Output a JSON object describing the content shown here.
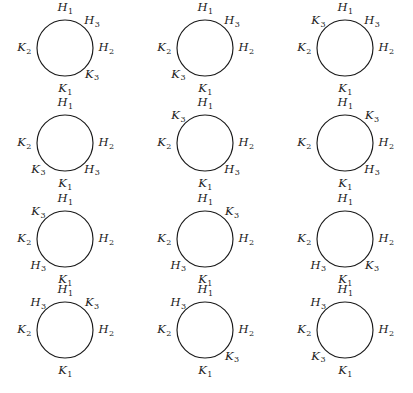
{
  "figure": {
    "background_color": "#ffffff",
    "stroke_color": "#1a1a1a",
    "grid": {
      "rows": 4,
      "columns": 3,
      "cell_count": 12
    },
    "circle": {
      "radius": 28,
      "stroke_width": 1.15
    },
    "label_symbols": [
      "H1",
      "H2",
      "H3",
      "K1",
      "K2",
      "K3"
    ],
    "angles_legend": {
      "top": 90,
      "upper_right": 45,
      "right": 0,
      "lower_right": 315,
      "bottom": 270,
      "lower_left": 225,
      "left": 180,
      "upper_left": 135
    }
  },
  "diagrams": [
    {
      "id": "diagram-1",
      "row": 1,
      "column": 1,
      "center_x": 65,
      "center_y": 48,
      "labels": [
        {
          "name": "H1",
          "base": "H",
          "sub": "1",
          "angle": 90
        },
        {
          "name": "H3",
          "base": "H",
          "sub": "3",
          "angle": 45
        },
        {
          "name": "H2",
          "base": "H",
          "sub": "2",
          "angle": 0
        },
        {
          "name": "K3",
          "base": "K",
          "sub": "3",
          "angle": 315
        },
        {
          "name": "K1",
          "base": "K",
          "sub": "1",
          "angle": 270
        },
        {
          "name": "K2",
          "base": "K",
          "sub": "2",
          "angle": 180
        }
      ]
    },
    {
      "id": "diagram-2",
      "row": 1,
      "column": 2,
      "center_x": 205,
      "center_y": 48,
      "labels": [
        {
          "name": "H1",
          "base": "H",
          "sub": "1",
          "angle": 90
        },
        {
          "name": "H3",
          "base": "H",
          "sub": "3",
          "angle": 45
        },
        {
          "name": "H2",
          "base": "H",
          "sub": "2",
          "angle": 0
        },
        {
          "name": "K1",
          "base": "K",
          "sub": "1",
          "angle": 270
        },
        {
          "name": "K3",
          "base": "K",
          "sub": "3",
          "angle": 225
        },
        {
          "name": "K2",
          "base": "K",
          "sub": "2",
          "angle": 180
        }
      ]
    },
    {
      "id": "diagram-3",
      "row": 1,
      "column": 3,
      "center_x": 345,
      "center_y": 48,
      "labels": [
        {
          "name": "H1",
          "base": "H",
          "sub": "1",
          "angle": 90
        },
        {
          "name": "H3",
          "base": "H",
          "sub": "3",
          "angle": 45
        },
        {
          "name": "H2",
          "base": "H",
          "sub": "2",
          "angle": 0
        },
        {
          "name": "K1",
          "base": "K",
          "sub": "1",
          "angle": 270
        },
        {
          "name": "K2",
          "base": "K",
          "sub": "2",
          "angle": 180
        },
        {
          "name": "K3",
          "base": "K",
          "sub": "3",
          "angle": 135
        }
      ]
    },
    {
      "id": "diagram-4",
      "row": 2,
      "column": 1,
      "center_x": 65,
      "center_y": 143,
      "labels": [
        {
          "name": "H1",
          "base": "H",
          "sub": "1",
          "angle": 90
        },
        {
          "name": "H2",
          "base": "H",
          "sub": "2",
          "angle": 0
        },
        {
          "name": "H3",
          "base": "H",
          "sub": "3",
          "angle": 315
        },
        {
          "name": "K1",
          "base": "K",
          "sub": "1",
          "angle": 270
        },
        {
          "name": "K3",
          "base": "K",
          "sub": "3",
          "angle": 225
        },
        {
          "name": "K2",
          "base": "K",
          "sub": "2",
          "angle": 180
        }
      ]
    },
    {
      "id": "diagram-5",
      "row": 2,
      "column": 2,
      "center_x": 205,
      "center_y": 143,
      "labels": [
        {
          "name": "H1",
          "base": "H",
          "sub": "1",
          "angle": 90
        },
        {
          "name": "H2",
          "base": "H",
          "sub": "2",
          "angle": 0
        },
        {
          "name": "H3",
          "base": "H",
          "sub": "3",
          "angle": 315
        },
        {
          "name": "K1",
          "base": "K",
          "sub": "1",
          "angle": 270
        },
        {
          "name": "K2",
          "base": "K",
          "sub": "2",
          "angle": 180
        },
        {
          "name": "K3",
          "base": "K",
          "sub": "3",
          "angle": 135
        }
      ]
    },
    {
      "id": "diagram-6",
      "row": 2,
      "column": 3,
      "center_x": 345,
      "center_y": 143,
      "labels": [
        {
          "name": "H1",
          "base": "H",
          "sub": "1",
          "angle": 90
        },
        {
          "name": "K3",
          "base": "K",
          "sub": "3",
          "angle": 45
        },
        {
          "name": "H2",
          "base": "H",
          "sub": "2",
          "angle": 0
        },
        {
          "name": "H3",
          "base": "H",
          "sub": "3",
          "angle": 315
        },
        {
          "name": "K1",
          "base": "K",
          "sub": "1",
          "angle": 270
        },
        {
          "name": "K2",
          "base": "K",
          "sub": "2",
          "angle": 180
        }
      ]
    },
    {
      "id": "diagram-7",
      "row": 3,
      "column": 1,
      "center_x": 65,
      "center_y": 239,
      "labels": [
        {
          "name": "H1",
          "base": "H",
          "sub": "1",
          "angle": 90
        },
        {
          "name": "H2",
          "base": "H",
          "sub": "2",
          "angle": 0
        },
        {
          "name": "K1",
          "base": "K",
          "sub": "1",
          "angle": 270
        },
        {
          "name": "H3",
          "base": "H",
          "sub": "3",
          "angle": 225
        },
        {
          "name": "K2",
          "base": "K",
          "sub": "2",
          "angle": 180
        },
        {
          "name": "K3",
          "base": "K",
          "sub": "3",
          "angle": 135
        }
      ]
    },
    {
      "id": "diagram-8",
      "row": 3,
      "column": 2,
      "center_x": 205,
      "center_y": 239,
      "labels": [
        {
          "name": "H1",
          "base": "H",
          "sub": "1",
          "angle": 90
        },
        {
          "name": "K3",
          "base": "K",
          "sub": "3",
          "angle": 45
        },
        {
          "name": "H2",
          "base": "H",
          "sub": "2",
          "angle": 0
        },
        {
          "name": "K1",
          "base": "K",
          "sub": "1",
          "angle": 270
        },
        {
          "name": "H3",
          "base": "H",
          "sub": "3",
          "angle": 225
        },
        {
          "name": "K2",
          "base": "K",
          "sub": "2",
          "angle": 180
        }
      ]
    },
    {
      "id": "diagram-9",
      "row": 3,
      "column": 3,
      "center_x": 345,
      "center_y": 239,
      "labels": [
        {
          "name": "H1",
          "base": "H",
          "sub": "1",
          "angle": 90
        },
        {
          "name": "H2",
          "base": "H",
          "sub": "2",
          "angle": 0
        },
        {
          "name": "K3",
          "base": "K",
          "sub": "3",
          "angle": 315
        },
        {
          "name": "K1",
          "base": "K",
          "sub": "1",
          "angle": 270
        },
        {
          "name": "H3",
          "base": "H",
          "sub": "3",
          "angle": 225
        },
        {
          "name": "K2",
          "base": "K",
          "sub": "2",
          "angle": 180
        }
      ]
    },
    {
      "id": "diagram-10",
      "row": 4,
      "column": 1,
      "center_x": 65,
      "center_y": 330,
      "labels": [
        {
          "name": "H1",
          "base": "H",
          "sub": "1",
          "angle": 90
        },
        {
          "name": "K3",
          "base": "K",
          "sub": "3",
          "angle": 45
        },
        {
          "name": "H2",
          "base": "H",
          "sub": "2",
          "angle": 0
        },
        {
          "name": "K1",
          "base": "K",
          "sub": "1",
          "angle": 270
        },
        {
          "name": "K2",
          "base": "K",
          "sub": "2",
          "angle": 180
        },
        {
          "name": "H3",
          "base": "H",
          "sub": "3",
          "angle": 135
        }
      ]
    },
    {
      "id": "diagram-11",
      "row": 4,
      "column": 2,
      "center_x": 205,
      "center_y": 330,
      "labels": [
        {
          "name": "H1",
          "base": "H",
          "sub": "1",
          "angle": 90
        },
        {
          "name": "H2",
          "base": "H",
          "sub": "2",
          "angle": 0
        },
        {
          "name": "K3",
          "base": "K",
          "sub": "3",
          "angle": 315
        },
        {
          "name": "K1",
          "base": "K",
          "sub": "1",
          "angle": 270
        },
        {
          "name": "K2",
          "base": "K",
          "sub": "2",
          "angle": 180
        },
        {
          "name": "H3",
          "base": "H",
          "sub": "3",
          "angle": 135
        }
      ]
    },
    {
      "id": "diagram-12",
      "row": 4,
      "column": 3,
      "center_x": 345,
      "center_y": 330,
      "labels": [
        {
          "name": "H1",
          "base": "H",
          "sub": "1",
          "angle": 90
        },
        {
          "name": "H2",
          "base": "H",
          "sub": "2",
          "angle": 0
        },
        {
          "name": "K1",
          "base": "K",
          "sub": "1",
          "angle": 270
        },
        {
          "name": "K3",
          "base": "K",
          "sub": "3",
          "angle": 225
        },
        {
          "name": "K2",
          "base": "K",
          "sub": "2",
          "angle": 180
        },
        {
          "name": "H3",
          "base": "H",
          "sub": "3",
          "angle": 135
        }
      ]
    }
  ]
}
